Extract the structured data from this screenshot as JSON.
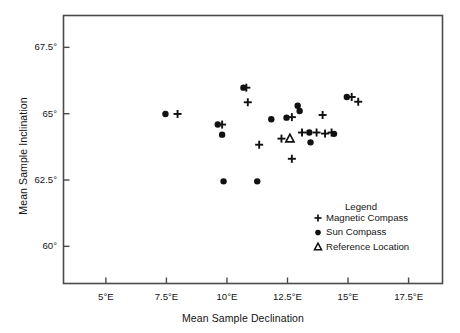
{
  "chart_data": {
    "type": "scatter",
    "title": "",
    "xlabel": "Mean Sample Declination",
    "ylabel": "Mean Sample Inclination",
    "xlim": [
      3.25,
      18.9
    ],
    "ylim": [
      58.6,
      68.7
    ],
    "grid": false,
    "legend_position": "inside-lower-right",
    "legend_title": "Legend",
    "xticks": [
      5,
      7.5,
      10,
      12.5,
      15,
      17.5
    ],
    "xtick_labels": [
      "5°E",
      "7.5°E",
      "10°E",
      "12.5°E",
      "15°E",
      "17.5°E"
    ],
    "yticks": [
      60,
      62.5,
      65,
      67.5
    ],
    "ytick_labels": [
      "60°",
      "62.5°",
      "65°",
      "67.5°"
    ],
    "series": [
      {
        "name": "Magnetic Compass",
        "marker": "plus",
        "color": "#111111",
        "points": [
          {
            "x": 7.96,
            "y": 64.99
          },
          {
            "x": 9.8,
            "y": 64.59
          },
          {
            "x": 10.8,
            "y": 65.98
          },
          {
            "x": 10.86,
            "y": 65.43
          },
          {
            "x": 11.33,
            "y": 63.83
          },
          {
            "x": 12.25,
            "y": 64.06
          },
          {
            "x": 12.68,
            "y": 64.87
          },
          {
            "x": 12.68,
            "y": 63.3
          },
          {
            "x": 13.1,
            "y": 64.29
          },
          {
            "x": 13.7,
            "y": 64.29
          },
          {
            "x": 13.95,
            "y": 64.95
          },
          {
            "x": 14.05,
            "y": 64.25
          },
          {
            "x": 14.32,
            "y": 64.29
          },
          {
            "x": 15.15,
            "y": 65.63
          },
          {
            "x": 15.42,
            "y": 65.45
          }
        ]
      },
      {
        "name": "Sun Compass",
        "marker": "circle",
        "color": "#111111",
        "points": [
          {
            "x": 7.46,
            "y": 64.99
          },
          {
            "x": 9.62,
            "y": 64.59
          },
          {
            "x": 9.8,
            "y": 64.21
          },
          {
            "x": 9.86,
            "y": 62.45
          },
          {
            "x": 10.68,
            "y": 65.98
          },
          {
            "x": 11.25,
            "y": 62.45
          },
          {
            "x": 11.83,
            "y": 64.79
          },
          {
            "x": 12.46,
            "y": 64.85
          },
          {
            "x": 12.92,
            "y": 65.3
          },
          {
            "x": 13.0,
            "y": 65.1
          },
          {
            "x": 13.4,
            "y": 64.29
          },
          {
            "x": 13.45,
            "y": 63.92
          },
          {
            "x": 14.42,
            "y": 64.24
          },
          {
            "x": 14.95,
            "y": 65.63
          }
        ]
      },
      {
        "name": "Reference Location",
        "marker": "triangle",
        "color": "#111111",
        "points": [
          {
            "x": 12.6,
            "y": 64.06
          }
        ]
      }
    ]
  },
  "legend": {
    "title": "Legend",
    "entries": [
      {
        "marker": "plus",
        "label": "Magnetic Compass"
      },
      {
        "marker": "circle",
        "label": "Sun Compass"
      },
      {
        "marker": "triangle",
        "label": "Reference Location"
      }
    ]
  },
  "axes": {
    "x_title": "Mean Sample Declination",
    "y_title": "Mean Sample Inclination"
  }
}
